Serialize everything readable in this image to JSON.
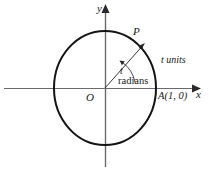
{
  "figure": {
    "axes": {
      "y_label": "y",
      "x_label": "x",
      "origin_label": "O"
    },
    "points": {
      "P": "P",
      "A": "A(1, 0)"
    },
    "annotations": {
      "arc_length": "t units",
      "angle_symbol": "t",
      "angle_unit": "radians"
    },
    "colors": {
      "stroke": "#1a1a1a",
      "background": "#ffffff",
      "thin_stroke": "#555555"
    },
    "geometry": {
      "center_x": 105,
      "center_y": 88,
      "radius_x": 51,
      "radius_y": 57,
      "angle_degrees": 48
    }
  }
}
